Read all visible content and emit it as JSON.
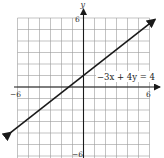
{
  "chart_data": {
    "type": "line",
    "title": "",
    "xlabel": "x",
    "ylabel": "y",
    "xlim": [
      -6,
      6
    ],
    "ylim": [
      -6,
      6
    ],
    "grid": true,
    "grid_step": 1,
    "x_tick_labels": [
      "-6",
      "6"
    ],
    "y_tick_labels": [
      "6",
      "-6"
    ],
    "series": [
      {
        "name": "-3x + 4y = 4",
        "equation": "-3x + 4y = 4",
        "slope": 0.75,
        "intercept": 1,
        "x": [
          -6.6,
          -6,
          0,
          6,
          6.5
        ],
        "y": [
          -3.95,
          -3.5,
          1,
          5.5,
          5.875
        ],
        "arrows": "both"
      }
    ],
    "annotations": [
      {
        "text": "−3x + 4y = 4",
        "x": 1.1,
        "y": 1.5
      }
    ]
  },
  "labels": {
    "x_axis_name": "x",
    "y_axis_name": "y",
    "x_min": "−6",
    "x_max": "6",
    "y_max": "6",
    "y_min": "−6",
    "equation": "−3x + 4y = 4"
  },
  "colors": {
    "line": "#1a1a1a",
    "grid": "#9a9a9a",
    "background": "#ffffff"
  }
}
